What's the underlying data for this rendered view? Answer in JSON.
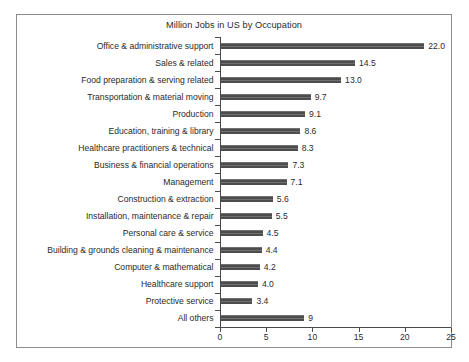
{
  "chart_data": {
    "type": "bar",
    "orientation": "horizontal",
    "title": "Million Jobs in US by Occupation",
    "xlabel": "",
    "ylabel": "",
    "xlim": [
      0,
      25
    ],
    "xticks": [
      0,
      5,
      10,
      15,
      20,
      25
    ],
    "xtick_labels": [
      "0",
      "5",
      "10",
      "15",
      "20",
      "25"
    ],
    "grid": false,
    "legend": null,
    "bar_color": "#4d4d4d",
    "frame_color": "#8c8c8c",
    "categories": [
      "Office & administrative support",
      "Sales & related",
      "Food preparation & serving related",
      "Transportation & material moving",
      "Production",
      "Education, training & library",
      "Healthcare practitioners & technical",
      "Business & financial operations",
      "Management",
      "Construction & extraction",
      "Installation, maintenance & repair",
      "Personal care & service",
      "Building & grounds cleaning & maintenance",
      "Computer & mathematical",
      "Healthcare support",
      "Protective service",
      "All others"
    ],
    "values": [
      22.0,
      14.5,
      13.0,
      9.7,
      9.1,
      8.6,
      8.3,
      7.3,
      7.1,
      5.6,
      5.5,
      4.5,
      4.4,
      4.2,
      4.0,
      3.4,
      9
    ],
    "value_labels": [
      "22.0",
      "14.5",
      "13.0",
      "9.7",
      "9.1",
      "8.6",
      "8.3",
      "7.3",
      "7.1",
      "5.6",
      "5.5",
      "4.5",
      "4.4",
      "4.2",
      "4.0",
      "3.4",
      "9"
    ]
  }
}
